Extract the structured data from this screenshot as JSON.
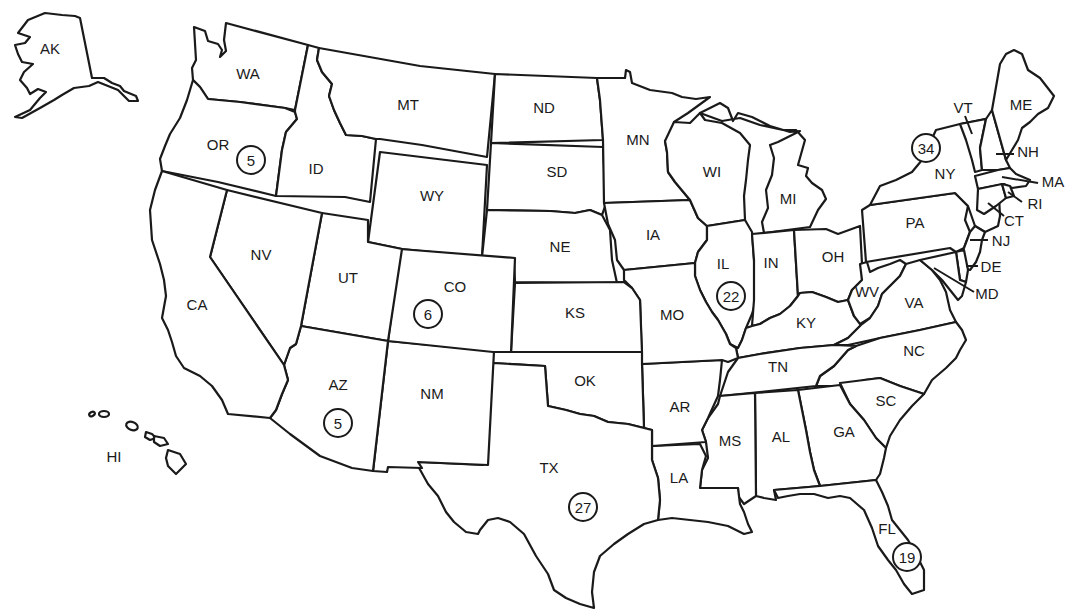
{
  "map": {
    "title": "United States map with state abbreviations and circled counts",
    "background": "#ffffff",
    "line_color": "#1a1a1a",
    "states": [
      {
        "abbr": "AK",
        "x": 50,
        "y": 50
      },
      {
        "abbr": "WA",
        "x": 248,
        "y": 75
      },
      {
        "abbr": "OR",
        "x": 218,
        "y": 146
      },
      {
        "abbr": "ID",
        "x": 316,
        "y": 170
      },
      {
        "abbr": "MT",
        "x": 408,
        "y": 106
      },
      {
        "abbr": "ND",
        "x": 544,
        "y": 109
      },
      {
        "abbr": "MN",
        "x": 638,
        "y": 141
      },
      {
        "abbr": "WI",
        "x": 712,
        "y": 173
      },
      {
        "abbr": "MI",
        "x": 788,
        "y": 200
      },
      {
        "abbr": "SD",
        "x": 557,
        "y": 173
      },
      {
        "abbr": "WY",
        "x": 432,
        "y": 197
      },
      {
        "abbr": "NV",
        "x": 261,
        "y": 256
      },
      {
        "abbr": "UT",
        "x": 348,
        "y": 279
      },
      {
        "abbr": "CO",
        "x": 455,
        "y": 288
      },
      {
        "abbr": "NE",
        "x": 560,
        "y": 248
      },
      {
        "abbr": "IA",
        "x": 653,
        "y": 236
      },
      {
        "abbr": "IL",
        "x": 723,
        "y": 265
      },
      {
        "abbr": "IN",
        "x": 771,
        "y": 264
      },
      {
        "abbr": "OH",
        "x": 833,
        "y": 258
      },
      {
        "abbr": "PA",
        "x": 915,
        "y": 224
      },
      {
        "abbr": "NY",
        "x": 945,
        "y": 175
      },
      {
        "abbr": "VT",
        "x": 963,
        "y": 109
      },
      {
        "abbr": "ME",
        "x": 1021,
        "y": 106
      },
      {
        "abbr": "NH",
        "x": 1028,
        "y": 153
      },
      {
        "abbr": "MA",
        "x": 1053,
        "y": 183
      },
      {
        "abbr": "RI",
        "x": 1035,
        "y": 205
      },
      {
        "abbr": "CT",
        "x": 1014,
        "y": 222
      },
      {
        "abbr": "NJ",
        "x": 1001,
        "y": 242
      },
      {
        "abbr": "DE",
        "x": 991,
        "y": 268
      },
      {
        "abbr": "MD",
        "x": 987,
        "y": 295
      },
      {
        "abbr": "CA",
        "x": 197,
        "y": 306
      },
      {
        "abbr": "KS",
        "x": 575,
        "y": 314
      },
      {
        "abbr": "MO",
        "x": 672,
        "y": 316
      },
      {
        "abbr": "KY",
        "x": 806,
        "y": 324
      },
      {
        "abbr": "WV",
        "x": 867,
        "y": 293
      },
      {
        "abbr": "VA",
        "x": 914,
        "y": 304
      },
      {
        "abbr": "AZ",
        "x": 338,
        "y": 386
      },
      {
        "abbr": "NM",
        "x": 432,
        "y": 395
      },
      {
        "abbr": "OK",
        "x": 585,
        "y": 382
      },
      {
        "abbr": "AR",
        "x": 680,
        "y": 408
      },
      {
        "abbr": "TN",
        "x": 778,
        "y": 368
      },
      {
        "abbr": "NC",
        "x": 914,
        "y": 352
      },
      {
        "abbr": "SC",
        "x": 886,
        "y": 402
      },
      {
        "abbr": "MS",
        "x": 730,
        "y": 442
      },
      {
        "abbr": "AL",
        "x": 781,
        "y": 438
      },
      {
        "abbr": "GA",
        "x": 844,
        "y": 433
      },
      {
        "abbr": "TX",
        "x": 549,
        "y": 469
      },
      {
        "abbr": "LA",
        "x": 679,
        "y": 479
      },
      {
        "abbr": "FL",
        "x": 887,
        "y": 530
      },
      {
        "abbr": "HI",
        "x": 114,
        "y": 458
      }
    ],
    "badges": [
      {
        "state": "OR",
        "value": "5",
        "x": 251,
        "y": 160
      },
      {
        "state": "NY",
        "value": "34",
        "x": 926,
        "y": 148
      },
      {
        "state": "CO",
        "value": "6",
        "x": 428,
        "y": 314
      },
      {
        "state": "IL",
        "value": "22",
        "x": 731,
        "y": 296
      },
      {
        "state": "AZ",
        "value": "5",
        "x": 338,
        "y": 423
      },
      {
        "state": "TX",
        "value": "27",
        "x": 583,
        "y": 507
      },
      {
        "state": "FL",
        "value": "19",
        "x": 907,
        "y": 557
      }
    ]
  }
}
